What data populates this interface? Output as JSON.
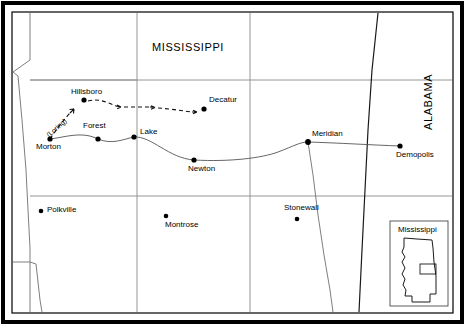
{
  "map": {
    "title_state": "MISSISSIPPI",
    "neighbor_state": "ALABAMA",
    "route_annotation": "(Loring)",
    "frame": {
      "outer_color": "#000000",
      "inner_color": "#000000",
      "background": "#ffffff"
    },
    "colors": {
      "county_line": "#7a7a7a",
      "state_line": "#000000",
      "rail_line": "#555555",
      "route_dashed": "#000000",
      "city_dot": "#000000",
      "text": "#000000"
    },
    "cities": [
      {
        "name": "Hillsboro",
        "dot_x": 84,
        "dot_y": 100,
        "label_x": 71,
        "label_y": 89,
        "label_align": "left"
      },
      {
        "name": "Decatur",
        "dot_x": 204,
        "dot_y": 109,
        "label_x": 209,
        "label_y": 97,
        "label_align": "left"
      },
      {
        "name": "Forest",
        "dot_x": 98,
        "dot_y": 139,
        "label_x": 83,
        "label_y": 124,
        "label_align": "left"
      },
      {
        "name": "Lake",
        "dot_x": 134,
        "dot_y": 137,
        "label_x": 140,
        "label_y": 128,
        "label_align": "left"
      },
      {
        "name": "Morton",
        "dot_x": 50,
        "dot_y": 139,
        "label_x": 36,
        "label_y": 144,
        "label_align": "left"
      },
      {
        "name": "Newton",
        "dot_x": 194,
        "dot_y": 160,
        "label_x": 188,
        "label_y": 166,
        "label_align": "left"
      },
      {
        "name": "Meridian",
        "dot_x": 308,
        "dot_y": 142,
        "label_x": 312,
        "label_y": 131,
        "label_align": "left"
      },
      {
        "name": "Demopolis",
        "dot_x": 400,
        "dot_y": 146,
        "label_x": 395,
        "label_y": 152,
        "label_align": "left"
      },
      {
        "name": "Polkville",
        "dot_x": 41,
        "dot_y": 211,
        "label_x": 47,
        "label_y": 206,
        "label_align": "left"
      },
      {
        "name": "Montrose",
        "dot_x": 166,
        "dot_y": 216,
        "label_x": 165,
        "label_y": 222,
        "label_align": "left"
      },
      {
        "name": "Stonewall",
        "dot_x": 297,
        "dot_y": 219,
        "label_x": 285,
        "label_y": 205,
        "label_align": "left"
      }
    ],
    "route": {
      "type": "dashed-arrow-march",
      "description": "Hillsboro to Decatur advance",
      "from": "Morton",
      "via": "Hillsboro",
      "to": "Decatur"
    },
    "rail": {
      "description": "Southern Railroad line",
      "stations": [
        "Morton",
        "Forest",
        "Lake",
        "Newton",
        "Meridian",
        "Demopolis"
      ]
    },
    "inset": {
      "title": "Mississippi",
      "highlight_box": true
    }
  }
}
